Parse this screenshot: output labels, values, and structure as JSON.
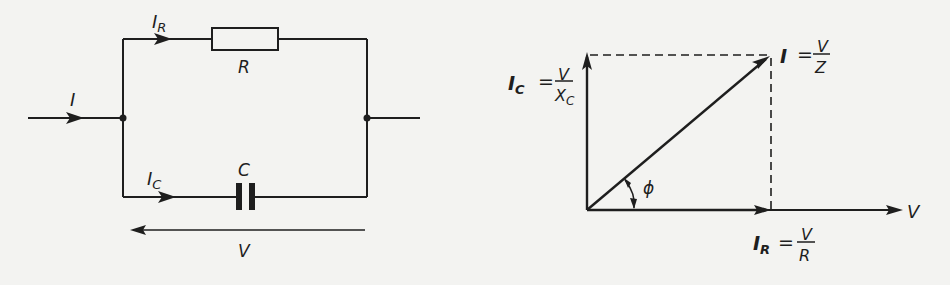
{
  "circuit": {
    "input_current": "I",
    "resistor_branch_current": {
      "main": "I",
      "sub": "R"
    },
    "capacitor_branch_current": {
      "main": "I",
      "sub": "C"
    },
    "resistor_label": "R",
    "capacitor_label": "C",
    "voltage_label": "V"
  },
  "phasor": {
    "ic_label": {
      "main": "I",
      "sub": "C",
      "eq": "=",
      "num": "V",
      "den_main": "X",
      "den_sub": "C"
    },
    "i_label": {
      "main": "I",
      "eq": "=",
      "num": "V",
      "den": "Z"
    },
    "ir_label": {
      "main": "I",
      "sub": "R",
      "eq": "=",
      "num": "V",
      "den": "R"
    },
    "axis_label": "V",
    "angle_label": "ϕ"
  },
  "colors": {
    "ink": "#1e1e1e",
    "background": "#f3f3f1"
  }
}
